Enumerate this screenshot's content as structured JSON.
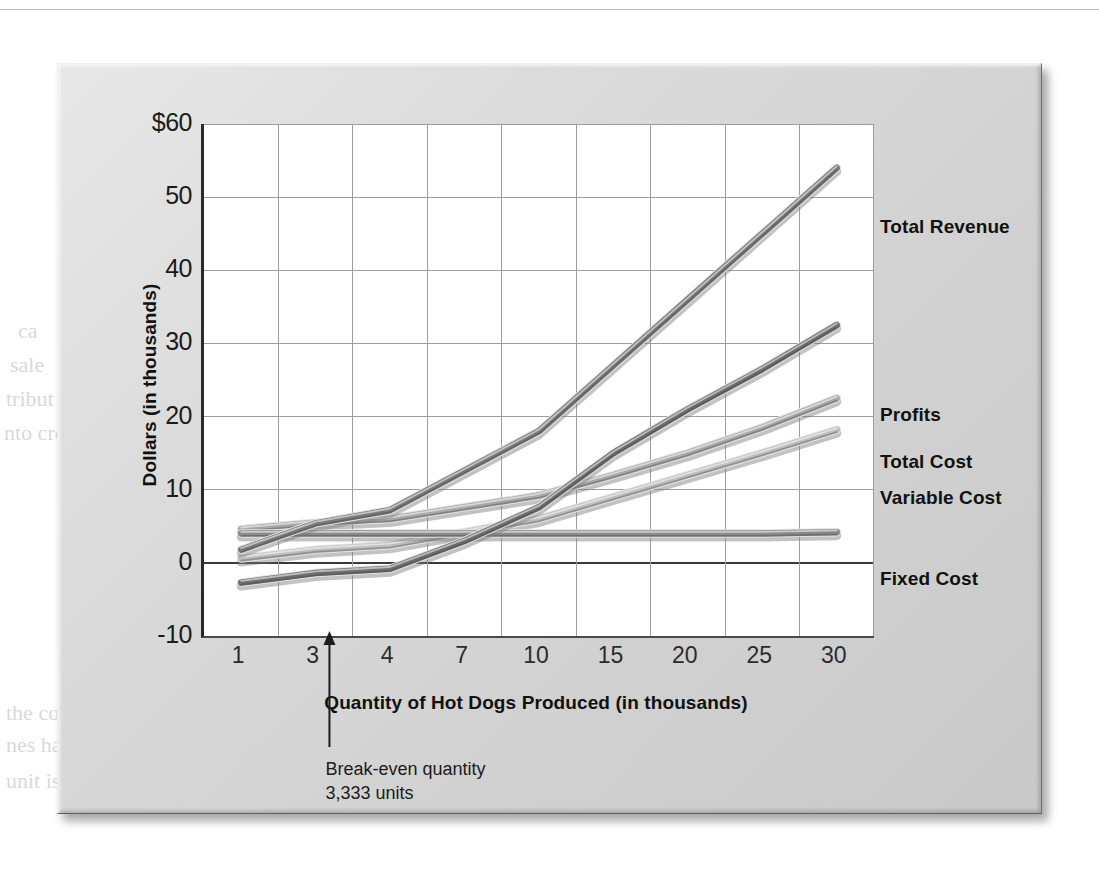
{
  "figure": {
    "kind": "textbook-figure-panel",
    "ghost_text": [
      {
        "t": "Websites such as the one shown here allow customers to",
        "x": 358,
        "y": 78,
        "size": 22,
        "bold": false
      },
      {
        "t": "compare gift card prices against each other and against the amount",
        "x": 300,
        "y": 108,
        "size": 22,
        "bold": false
      },
      {
        "t": "ift Cards",
        "x": 64,
        "y": 86,
        "size": 40,
        "bold": true
      },
      {
        "t": "de when",
        "x": 62,
        "y": 118,
        "size": 28,
        "bold": true
      },
      {
        "t": "specific cu",
        "x": 62,
        "y": 146,
        "size": 26,
        "bold": true
      },
      {
        "t": "was em",
        "x": 62,
        "y": 186,
        "size": 22,
        "bold": false
      },
      {
        "t": "ca",
        "x": 18,
        "y": 318,
        "size": 22,
        "bold": false
      },
      {
        "t": "sale",
        "x": 10,
        "y": 352,
        "size": 22,
        "bold": false
      },
      {
        "t": "tribut",
        "x": 6,
        "y": 386,
        "size": 22,
        "bold": false
      },
      {
        "t": "nto cre",
        "x": 4,
        "y": 420,
        "size": 22,
        "bold": false
      },
      {
        "t": "250,000 units",
        "x": 640,
        "y": 648,
        "size": 30,
        "bold": true
      },
      {
        "t": "the cost",
        "x": 6,
        "y": 700,
        "size": 22,
        "bold": false
      },
      {
        "t": "nes has",
        "x": 6,
        "y": 732,
        "size": 22,
        "bold": false
      },
      {
        "t": "unit is produced, costs are fixed or variable in nature",
        "x": 6,
        "y": 768,
        "size": 22,
        "bold": false
      },
      {
        "t": "Break-even analysis",
        "x": 420,
        "y": 700,
        "size": 22,
        "bold": false
      }
    ]
  },
  "chart_data": {
    "type": "line",
    "title": "",
    "xlabel": "Quantity of Hot Dogs Produced (in thousands)",
    "ylabel": "Dollars (in thousands)",
    "x_tick_labels": [
      "1",
      "3",
      "4",
      "7",
      "10",
      "15",
      "20",
      "25",
      "30"
    ],
    "categories": [
      1,
      3,
      4,
      7,
      10,
      15,
      20,
      25,
      30
    ],
    "ylim": [
      -10,
      60
    ],
    "y_tick_labels": [
      "$60",
      "50",
      "40",
      "30",
      "20",
      "10",
      "0",
      "-10"
    ],
    "y_ticks": [
      60,
      50,
      40,
      30,
      20,
      10,
      0,
      -10
    ],
    "grid": true,
    "legend_position": "right-inline",
    "zero_line": 0,
    "series": [
      {
        "name": "Total Revenue",
        "color": "#7a7a7a",
        "values": [
          1.8,
          5.4,
          7.2,
          12.6,
          18.0,
          27.0,
          36.0,
          45.0,
          54.0
        ]
      },
      {
        "name": "Profits",
        "color": "#6e6e6e",
        "values": [
          -2.7,
          -1.4,
          -0.8,
          3.0,
          7.6,
          15.0,
          21.0,
          26.5,
          32.5
        ]
      },
      {
        "name": "Total Cost",
        "color": "#a8a8a8",
        "values": [
          4.6,
          5.5,
          6.0,
          7.6,
          9.2,
          12.0,
          15.0,
          18.5,
          22.5
        ]
      },
      {
        "name": "Variable Cost",
        "color": "#bdbdbd",
        "values": [
          0.6,
          1.8,
          2.4,
          4.2,
          6.0,
          9.0,
          12.0,
          15.0,
          18.2
        ]
      },
      {
        "name": "Fixed Cost",
        "color": "#8a8a8a",
        "values": [
          4.0,
          4.0,
          4.0,
          4.0,
          4.0,
          4.0,
          4.0,
          4.0,
          4.2
        ]
      }
    ],
    "annotations": [
      {
        "name": "break-even",
        "text": "Break-even quantity\n3,333 units",
        "x_value": 3.333,
        "arrow": "up"
      }
    ]
  },
  "series_labels": [
    {
      "text": "Total Revenue",
      "top": 152
    },
    {
      "text": "Profits",
      "top": 340
    },
    {
      "text": "Total Cost",
      "top": 387
    },
    {
      "text": "Variable Cost",
      "top": 423
    },
    {
      "text": "Fixed Cost",
      "top": 504
    }
  ],
  "colors": {
    "panel": "#dcdcdc",
    "plot_bg": "#ffffff",
    "axis": "#2a2a2a",
    "grid": "#9a9a9a",
    "text": "#111111"
  }
}
